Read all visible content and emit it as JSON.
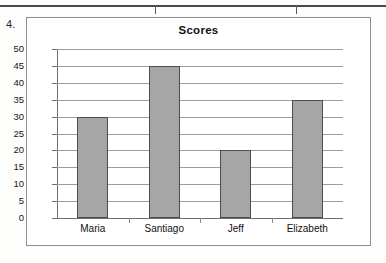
{
  "worksheet": {
    "question_number": "4."
  },
  "chart_data": {
    "type": "bar",
    "title": "Scores",
    "xlabel": "",
    "ylabel": "",
    "categories": [
      "Maria",
      "Santiago",
      "Jeff",
      "Elizabeth"
    ],
    "values": [
      30,
      45,
      20,
      35
    ],
    "ylim": [
      0,
      50
    ],
    "ytick_step": 5,
    "yticks": [
      "50",
      "45",
      "40",
      "35",
      "30",
      "25",
      "20",
      "15",
      "10",
      "5",
      "0"
    ],
    "grid": "horizontal",
    "legend": "none",
    "bar_color": "#a6a6a6",
    "bar_border_color": "#4d4d4d",
    "gridline_color": "#9d9d9d",
    "axis_color": "#6e6e6e",
    "frame_color": "#8e8e8e"
  }
}
